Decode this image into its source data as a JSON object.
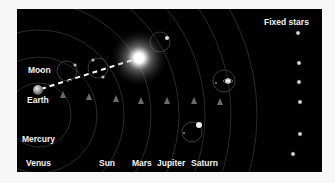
{
  "diagram": {
    "background_color": "#000000",
    "label_color": "#f2f2f2",
    "labels": {
      "fixed_stars": "Fixed stars",
      "moon": "Moon",
      "earth": "Earth",
      "mercury": "Mercury",
      "venus": "Venus",
      "sun": "Sun",
      "mars": "Mars",
      "jupiter": "Jupiter",
      "saturn": "Saturn"
    },
    "bodies": [
      {
        "name": "Earth",
        "role": "center"
      },
      {
        "name": "Moon",
        "role": "orbit-1"
      },
      {
        "name": "Mercury",
        "role": "epicycle"
      },
      {
        "name": "Venus",
        "role": "epicycle"
      },
      {
        "name": "Sun",
        "role": "glowing"
      },
      {
        "name": "Mars",
        "role": "epicycle"
      },
      {
        "name": "Jupiter",
        "role": "epicycle"
      },
      {
        "name": "Saturn",
        "role": "epicycle"
      }
    ],
    "fixed_star_count": 6,
    "orbit_markers": 7,
    "connector": "dashed line Earth-to-Sun"
  }
}
